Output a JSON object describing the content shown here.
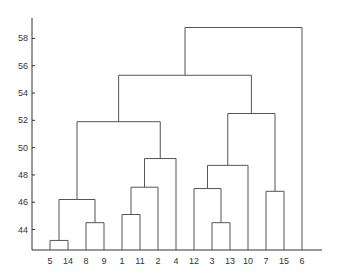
{
  "chart_data": {
    "type": "dendrogram",
    "title": "",
    "xlabel": "",
    "ylabel": "",
    "ylim": [
      42.5,
      60
    ],
    "yticks": [
      44,
      46,
      48,
      50,
      52,
      54,
      56,
      58
    ],
    "leaf_order": [
      "5",
      "14",
      "8",
      "9",
      "1",
      "11",
      "2",
      "4",
      "12",
      "3",
      "13",
      "10",
      "7",
      "15",
      "6"
    ],
    "merges": [
      {
        "left": "5",
        "right": "14",
        "height": 43.2
      },
      {
        "left": "8",
        "right": "9",
        "height": 44.5
      },
      {
        "left": "(5,14)",
        "right": "(8,9)",
        "height": 46.2
      },
      {
        "left": "1",
        "right": "11",
        "height": 45.1
      },
      {
        "left": "(1,11)",
        "right": "2",
        "height": 47.1
      },
      {
        "left": "((1,11),2)",
        "right": "4",
        "height": 49.2
      },
      {
        "left": "((5,14),(8,9))",
        "right": "(((1,11),2),4)",
        "height": 51.9
      },
      {
        "left": "3",
        "right": "13",
        "height": 44.5
      },
      {
        "left": "12",
        "right": "(3,13)",
        "height": 47.0
      },
      {
        "left": "(12,(3,13))",
        "right": "10",
        "height": 48.7
      },
      {
        "left": "7",
        "right": "15",
        "height": 46.8
      },
      {
        "left": "((12,(3,13)),10)",
        "right": "(7,15)",
        "height": 52.5
      },
      {
        "left": "left-cluster",
        "right": "right-cluster",
        "height": 55.3
      },
      {
        "left": "(left-cluster,right-cluster)",
        "right": "6",
        "height": 58.8
      }
    ],
    "grid": false,
    "legend": null
  },
  "axis": {
    "y_tick_labels": [
      "58",
      "56",
      "54",
      "52",
      "50",
      "48",
      "46",
      "44"
    ],
    "x_tick_labels": [
      "5",
      "14",
      "8",
      "9",
      "1",
      "11",
      "2",
      "4",
      "12",
      "3",
      "13",
      "10",
      "7",
      "15",
      "6"
    ]
  },
  "colors": {
    "line": "#555555",
    "axis": "#333333",
    "text": "#333333"
  }
}
